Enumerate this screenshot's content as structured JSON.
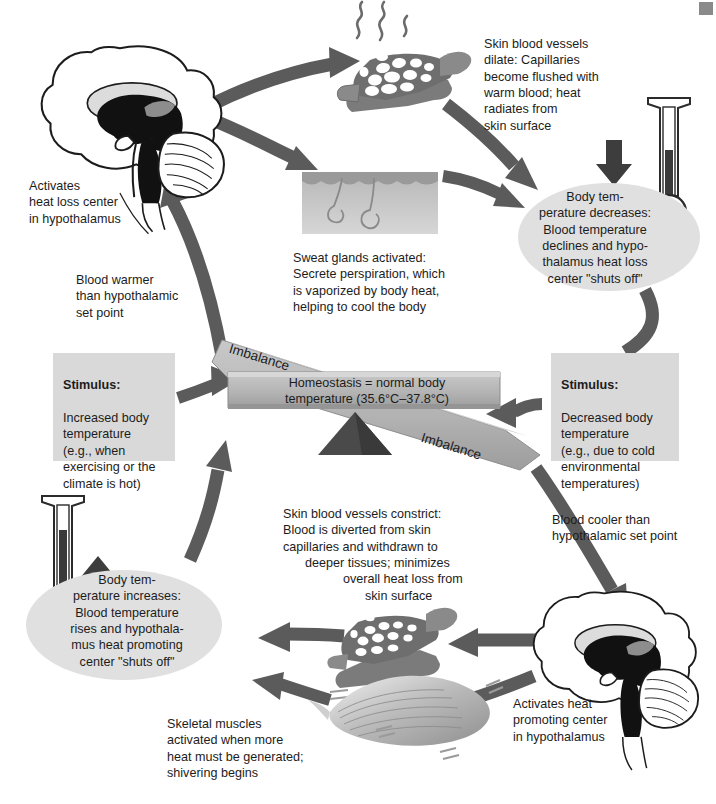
{
  "diagram": {
    "colors": {
      "page_background": "#ffffff",
      "arrow_gray": "#5b5b5b",
      "box_gray": "#d9d9d9",
      "oval_gray": "#e0e0e0",
      "beam_gray": "#b5b5b5",
      "fulcrum_dark": "#4a4a4a",
      "mercury_dark": "#3a3a3a",
      "text": "#1c1c1c"
    }
  },
  "balance": {
    "center_label": "Homeostasis = normal body\ntemperature (35.6°C–37.8°C)",
    "imbalance_left": "Imbalance",
    "imbalance_right": "Imbalance"
  },
  "stimulus_left": {
    "heading": "Stimulus:",
    "body": "Increased body\ntemperature\n(e.g., when\nexercising or the\nclimate is hot)"
  },
  "stimulus_right": {
    "heading": "Stimulus:",
    "body": "Decreased body\ntemperature\n(e.g., due to cold\nenvironmental\ntemperatures)"
  },
  "cooling_loop": {
    "hypothalamus_label": "Activates\nheat loss center\nin hypothalamus",
    "blood_warmer": "Blood warmer\nthan hypothalamic\nset point",
    "vessels_dilate": "Skin blood vessels\ndilate: Capillaries\nbecome flushed with\nwarm blood; heat\nradiates from\nskin surface",
    "sweat_glands": "Sweat glands activated:\nSecrete perspiration, which\nis vaporized by body heat,\nhelping to cool the body",
    "temp_decreases": "Body tem-\nperature decreases:\nBlood temperature\ndeclines and hypo-\nthalamus heat loss\ncenter \"shuts off\""
  },
  "warming_loop": {
    "hypothalamus_label": "Activates heat\npromoting center\nin hypothalamus",
    "blood_cooler": "Blood cooler than\nhypothalamic set point",
    "vessels_constrict_line1": "Skin blood vessels constrict:",
    "vessels_constrict_line2": "Blood is diverted from skin",
    "vessels_constrict_line3": "capillaries and withdrawn to",
    "vessels_constrict_line4": "deeper tissues; minimizes",
    "vessels_constrict_line5": "overall heat loss from",
    "vessels_constrict_line6": "skin surface",
    "skeletal_muscles": "Skeletal muscles\nactivated when more\nheat must be generated;\nshivering begins",
    "temp_increases": "Body tem-\nperature increases:\nBlood temperature\nrises and hypothala-\nmus heat promoting\ncenter \"shuts off\""
  },
  "icons": {
    "brain_top": "brain-sagittal-icon",
    "brain_bottom": "brain-sagittal-icon",
    "capillary_dilated": "capillary-bed-dilated-icon",
    "capillary_constricted": "capillary-bed-constricted-icon",
    "skin_sweat": "skin-sweat-gland-icon",
    "muscle": "skeletal-muscle-icon",
    "thermometer_down": "thermometer-falling-icon",
    "thermometer_up": "thermometer-rising-icon",
    "arrow_down": "down-arrow-icon",
    "arrow_up": "up-arrow-icon",
    "fulcrum": "fulcrum-triangle-icon"
  }
}
